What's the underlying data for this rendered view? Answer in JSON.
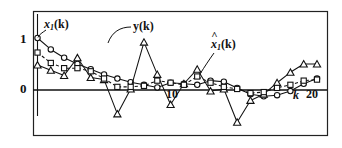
{
  "figure": {
    "background": "#ffffff",
    "ink": "#111111",
    "frame": {
      "x": 33,
      "y": 11,
      "w": 294,
      "h": 124,
      "stroke": "#222222"
    }
  },
  "annotations": {
    "signal_x1": {
      "base": "x",
      "sub": "1",
      "tail": "(k)",
      "text": "x1(k)"
    },
    "signal_y": {
      "text": "y(k)"
    },
    "signal_x1hat": {
      "base": "x",
      "sub": "1",
      "tail": "(k)",
      "hat": "^",
      "text": "x̂1(k)"
    },
    "ytick_one": "1",
    "ytick_zero": "0",
    "xtick_ten": "10",
    "xtick_twenty": "20",
    "xaxis_name": "k"
  },
  "chart_data": {
    "type": "line",
    "title": "",
    "xlabel": "k",
    "ylabel": "",
    "grid": false,
    "legend_position": "inline-annotations",
    "xlim": [
      0,
      21.6
    ],
    "ylim": [
      -0.95,
      1.35
    ],
    "yticks": [
      0,
      1
    ],
    "ytick_labels": [
      "0",
      "1"
    ],
    "xticks": [
      10,
      20
    ],
    "xtick_labels": [
      "10",
      "20"
    ],
    "zero_line": 0,
    "x": [
      0,
      1,
      2,
      3,
      4,
      5,
      6,
      7,
      8,
      9,
      10,
      11,
      12,
      13,
      14,
      15,
      16,
      17,
      18,
      19,
      20,
      21
    ],
    "series": [
      {
        "name": "x1(k)",
        "marker": "circle",
        "linestyle": "solid",
        "values": [
          1.0,
          0.78,
          0.62,
          0.5,
          0.4,
          0.3,
          0.22,
          0.15,
          0.1,
          0.05,
          0.14,
          0.12,
          0.1,
          0.18,
          0.16,
          0.04,
          -0.08,
          -0.12,
          -0.1,
          -0.02,
          0.12,
          0.22
        ]
      },
      {
        "name": "y(k)",
        "marker": "triangle",
        "linestyle": "solid",
        "values": [
          0.48,
          0.38,
          0.28,
          0.62,
          0.24,
          0.2,
          -0.46,
          0.02,
          0.92,
          0.3,
          -0.28,
          0.12,
          0.4,
          -0.02,
          0.02,
          -0.62,
          -0.2,
          -0.08,
          0.14,
          0.34,
          0.5,
          0.5
        ]
      },
      {
        "name": "x1hat(k)",
        "marker": "square",
        "linestyle": "dashed",
        "values": [
          0.72,
          0.52,
          0.42,
          0.42,
          0.36,
          0.22,
          0.06,
          0.06,
          0.08,
          0.18,
          0.14,
          0.1,
          0.26,
          0.14,
          0.06,
          0.02,
          -0.06,
          -0.04,
          0.04,
          0.1,
          0.18,
          0.2
        ]
      }
    ]
  }
}
